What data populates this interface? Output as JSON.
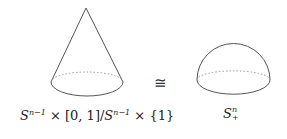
{
  "diagram": {
    "left": {
      "shape": "cone",
      "label": {
        "base": "S",
        "sup": "n−1",
        "rest1": " × [0, 1]/",
        "base2": "S",
        "sup2": "n−1",
        "rest2": " × {1}"
      }
    },
    "relation": "≅",
    "right": {
      "shape": "hemisphere",
      "label": {
        "base": "S",
        "sup": "n",
        "sub": "+"
      }
    },
    "colors": {
      "stroke": "#555555",
      "dashed": "#888888",
      "text": "#222222"
    }
  }
}
